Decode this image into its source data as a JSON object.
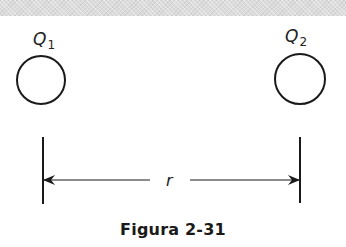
{
  "figure": {
    "caption": "Figura 2-31",
    "charges": [
      {
        "id": "Q1",
        "symbol": "Q",
        "subscript": "1",
        "cx": 41,
        "cy": 80,
        "r": 24,
        "label_x": 33,
        "label_y": 45
      },
      {
        "id": "Q2",
        "symbol": "Q",
        "subscript": "2",
        "cx": 300,
        "cy": 79,
        "r": 25,
        "label_x": 285,
        "label_y": 42
      }
    ],
    "distance": {
      "label": "r",
      "left_x": 43,
      "right_x": 300,
      "y": 180,
      "tick_top": 137,
      "tick_bottom": 204
    },
    "colors": {
      "stroke": "#1a1a1a",
      "band": "#dcdcdc"
    }
  }
}
